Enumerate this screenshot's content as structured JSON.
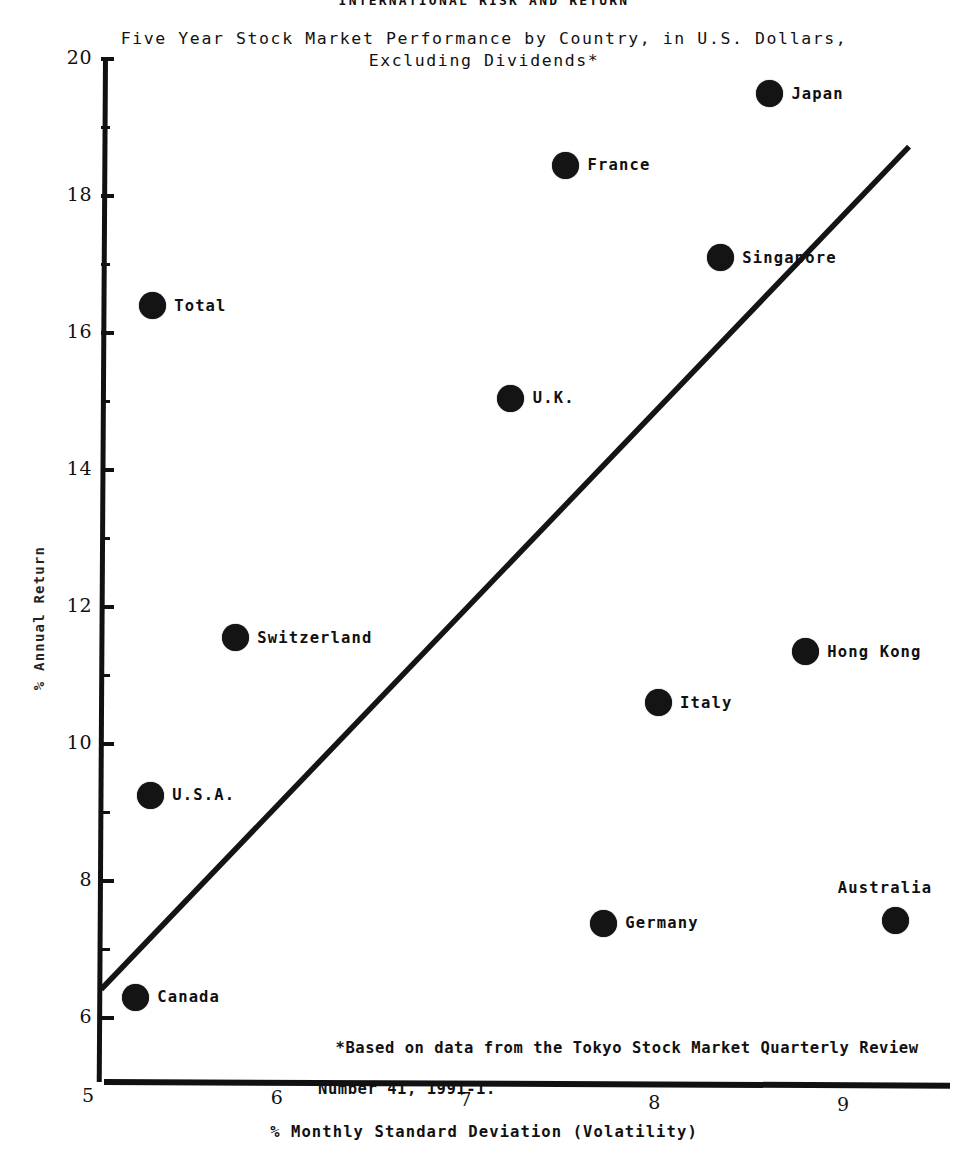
{
  "header": {
    "document_title": "INTERNATIONAL RISK AND RETURN",
    "subtitle_line1": "Five Year Stock Market Performance by Country, in U.S. Dollars,",
    "subtitle_line2": "Excluding Dividends*"
  },
  "footnote": {
    "line1": "*Based on data from the Tokyo Stock Market Quarterly Review",
    "line2": "Number 41, 1991-1."
  },
  "axes": {
    "y_title": "% Annual Return",
    "x_title": "% Monthly  Standard Deviation (Volatility)",
    "y_ticks": [
      "20",
      "18",
      "16",
      "14",
      "12",
      "10",
      "8",
      "6"
    ],
    "x_ticks": [
      "5",
      "6",
      "7",
      "8",
      "9"
    ]
  },
  "chart_data": {
    "type": "scatter",
    "title": "INTERNATIONAL RISK AND RETURN",
    "subtitle": "Five Year Stock Market Performance by Country, in U.S. Dollars, Excluding Dividends*",
    "xlabel": "% Monthly  Standard Deviation (Volatility)",
    "ylabel": "% Annual Return",
    "xlim": [
      4.95,
      9.55
    ],
    "ylim": [
      5.3,
      20.0
    ],
    "xticks": [
      5,
      6,
      7,
      8,
      9
    ],
    "yticks": [
      6,
      8,
      10,
      12,
      14,
      16,
      18,
      20
    ],
    "y_minor_ticks": [
      7,
      9,
      11,
      13,
      15,
      17,
      19
    ],
    "grid": false,
    "legend": "none",
    "marker": "filled-circle",
    "marker_color": "#141414",
    "points": [
      {
        "label": "Japan",
        "x": 8.61,
        "y": 19.49,
        "label_pos": "right"
      },
      {
        "label": "France",
        "x": 7.53,
        "y": 18.45,
        "label_pos": "right"
      },
      {
        "label": "Singapore",
        "x": 8.35,
        "y": 17.1,
        "label_pos": "right"
      },
      {
        "label": "Total",
        "x": 5.34,
        "y": 16.4,
        "label_pos": "right"
      },
      {
        "label": "U.K.",
        "x": 7.24,
        "y": 15.05,
        "label_pos": "right"
      },
      {
        "label": "Switzerland",
        "x": 5.78,
        "y": 11.55,
        "label_pos": "right"
      },
      {
        "label": "Hong Kong",
        "x": 8.8,
        "y": 11.35,
        "label_pos": "right"
      },
      {
        "label": "Italy",
        "x": 8.02,
        "y": 10.6,
        "label_pos": "right"
      },
      {
        "label": "U.S.A.",
        "x": 5.33,
        "y": 9.25,
        "label_pos": "right"
      },
      {
        "label": "Australia",
        "x": 9.28,
        "y": 7.42,
        "label_pos": "above"
      },
      {
        "label": "Germany",
        "x": 7.73,
        "y": 7.38,
        "label_pos": "right"
      },
      {
        "label": "Canada",
        "x": 5.25,
        "y": 6.3,
        "label_pos": "right"
      }
    ],
    "trendline": {
      "type": "line",
      "description": "security-market-line",
      "x_start": 5.07,
      "y_start": 6.42,
      "x_end": 9.35,
      "y_end": 18.72
    },
    "annotations": [
      "*Based on data from the Tokyo Stock Market Quarterly Review",
      "Number 41, 1991-1."
    ]
  }
}
